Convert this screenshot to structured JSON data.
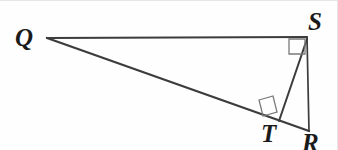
{
  "figure": {
    "kind": "geometry-diagram",
    "canvas": {
      "width": 338,
      "height": 150,
      "background": "#fefefe"
    },
    "stroke_color": "#3c3c3c",
    "label_color": "#1a1a1a",
    "vertices": [
      {
        "id": "Q",
        "label": "Q",
        "x": 47,
        "y": 38,
        "label_x": 15,
        "label_y": 25
      },
      {
        "id": "S",
        "label": "S",
        "x": 307,
        "y": 37,
        "label_x": 308,
        "label_y": 9
      },
      {
        "id": "T",
        "label": "T",
        "x": 280,
        "y": 120,
        "label_x": 261,
        "label_y": 121
      },
      {
        "id": "R",
        "label": "R",
        "x": 309,
        "y": 131,
        "label_x": 302,
        "label_y": 130
      }
    ],
    "segments": [
      {
        "id": "QS",
        "from": "Q",
        "to": "S",
        "x1": 47,
        "y1": 38,
        "x2": 307,
        "y2": 37
      },
      {
        "id": "QR",
        "from": "Q",
        "to": "R",
        "x1": 47,
        "y1": 38,
        "x2": 309,
        "y2": 131
      },
      {
        "id": "SR",
        "from": "S",
        "to": "R",
        "x1": 307,
        "y1": 37,
        "x2": 309,
        "y2": 131
      },
      {
        "id": "ST",
        "from": "S",
        "to": "T",
        "x1": 307,
        "y1": 39,
        "x2": 279,
        "y2": 121
      }
    ],
    "right_angle_marks": [
      {
        "id": "right-angle-at-S",
        "at": "S",
        "points": "289,39 289,54 305,54 305,39"
      },
      {
        "id": "right-angle-at-T",
        "at": "T",
        "points": "259,100 273,96 277,112 263,116"
      }
    ]
  }
}
